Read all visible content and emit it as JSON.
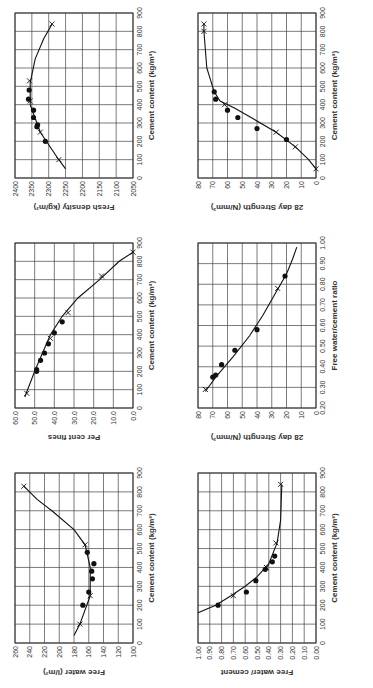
{
  "figure": {
    "rotation_deg": -90,
    "marker_legend": {
      "dot": "measured data point",
      "cross": "curve reference point"
    }
  },
  "chart_data": [
    {
      "id": "free-water",
      "type": "line",
      "xlabel": "Cement content (kg/m³)",
      "ylabel": "Free water (l/m³)",
      "xlim": [
        0,
        900
      ],
      "ylim": [
        100,
        260
      ],
      "xticks": [
        0,
        100,
        200,
        300,
        400,
        500,
        600,
        700,
        800,
        900
      ],
      "yticks": [
        100,
        120,
        140,
        160,
        180,
        200,
        220,
        240,
        260
      ],
      "grid": true,
      "curve": [
        [
          40,
          180
        ],
        [
          100,
          172
        ],
        [
          250,
          158
        ],
        [
          400,
          158
        ],
        [
          520,
          165
        ],
        [
          600,
          180
        ],
        [
          700,
          210
        ],
        [
          760,
          230
        ],
        [
          830,
          248
        ]
      ],
      "crosses": [
        [
          100,
          172
        ],
        [
          250,
          158
        ],
        [
          520,
          165
        ],
        [
          830,
          248
        ]
      ],
      "points": [
        [
          200,
          168
        ],
        [
          270,
          160
        ],
        [
          340,
          155
        ],
        [
          380,
          156
        ],
        [
          420,
          153
        ],
        [
          480,
          162
        ]
      ]
    },
    {
      "id": "per-cent-fines",
      "type": "line",
      "xlabel": "Cement content (kg/m³)",
      "ylabel": "Per cent fines",
      "xlim": [
        0,
        900
      ],
      "ylim": [
        0,
        60
      ],
      "xticks": [
        0,
        100,
        200,
        300,
        400,
        500,
        600,
        700,
        800,
        900
      ],
      "yticks": [
        "0.0",
        "10.0",
        "20.0",
        "30.0",
        "40.0",
        "50.0",
        "60.0"
      ],
      "grid": true,
      "curve": [
        [
          60,
          55
        ],
        [
          200,
          50
        ],
        [
          300,
          46
        ],
        [
          400,
          42
        ],
        [
          500,
          36
        ],
        [
          600,
          28
        ],
        [
          700,
          17
        ],
        [
          800,
          7
        ],
        [
          850,
          0
        ]
      ],
      "crosses": [
        [
          80,
          54
        ],
        [
          380,
          42
        ],
        [
          520,
          33
        ],
        [
          720,
          16
        ],
        [
          850,
          0
        ]
      ],
      "points": [
        [
          200,
          49
        ],
        [
          210,
          49
        ],
        [
          260,
          47
        ],
        [
          300,
          45
        ],
        [
          350,
          43
        ],
        [
          410,
          40
        ],
        [
          470,
          36
        ]
      ]
    },
    {
      "id": "fresh-density",
      "type": "line",
      "xlabel": "Cement content (kg/m³)",
      "ylabel": "Fresh density (kg/m³)",
      "xlim": [
        0,
        900
      ],
      "ylim": [
        2050,
        2400
      ],
      "xticks": [
        0,
        100,
        200,
        300,
        400,
        500,
        600,
        700,
        800,
        900
      ],
      "yticks": [
        2050,
        2100,
        2150,
        2200,
        2250,
        2300,
        2350,
        2400
      ],
      "grid": true,
      "curve": [
        [
          50,
          2250
        ],
        [
          100,
          2270
        ],
        [
          250,
          2325
        ],
        [
          400,
          2355
        ],
        [
          520,
          2355
        ],
        [
          650,
          2340
        ],
        [
          760,
          2315
        ],
        [
          840,
          2290
        ]
      ],
      "crosses": [
        [
          100,
          2270
        ],
        [
          250,
          2325
        ],
        [
          420,
          2355
        ],
        [
          530,
          2357
        ],
        [
          840,
          2290
        ]
      ],
      "points": [
        [
          200,
          2310
        ],
        [
          280,
          2335
        ],
        [
          290,
          2333
        ],
        [
          330,
          2345
        ],
        [
          370,
          2345
        ],
        [
          430,
          2360
        ],
        [
          480,
          2358
        ]
      ]
    },
    {
      "id": "wc-vs-cement",
      "type": "line",
      "xlabel": "Cement content (kg/m³)",
      "ylabel": "Free water/ cement",
      "xlim": [
        0,
        900
      ],
      "ylim": [
        0,
        1.0
      ],
      "xticks": [
        0,
        100,
        200,
        300,
        400,
        500,
        600,
        700,
        800,
        900
      ],
      "yticks": [
        "0.00",
        "0.10",
        "0.20",
        "0.30",
        "0.40",
        "0.50",
        "0.60",
        "0.70",
        "0.80",
        "0.90",
        "1.00"
      ],
      "grid": true,
      "curve": [
        [
          160,
          1.0
        ],
        [
          200,
          0.85
        ],
        [
          250,
          0.72
        ],
        [
          300,
          0.6
        ],
        [
          350,
          0.5
        ],
        [
          420,
          0.4
        ],
        [
          530,
          0.33
        ],
        [
          650,
          0.3
        ],
        [
          840,
          0.29
        ]
      ],
      "crosses": [
        [
          250,
          0.7
        ],
        [
          400,
          0.42
        ],
        [
          530,
          0.34
        ],
        [
          840,
          0.3
        ]
      ],
      "points": [
        [
          200,
          0.83
        ],
        [
          270,
          0.59
        ],
        [
          330,
          0.51
        ],
        [
          390,
          0.43
        ],
        [
          430,
          0.37
        ],
        [
          460,
          0.35
        ]
      ]
    },
    {
      "id": "strength-vs-wc",
      "type": "line",
      "xlabel": "Free water/cement ratio",
      "ylabel": "28 day Strength (N/mm²)",
      "xlim": [
        0.2,
        1.0
      ],
      "ylim": [
        0,
        80
      ],
      "xticks": [
        "0.20",
        "0.30",
        "0.40",
        "0.50",
        "0.60",
        "0.70",
        "0.80",
        "0.90",
        "1.00"
      ],
      "yticks": [
        0,
        10,
        20,
        30,
        40,
        50,
        60,
        70,
        80
      ],
      "grid": true,
      "curve": [
        [
          0.28,
          75
        ],
        [
          0.35,
          68
        ],
        [
          0.45,
          56
        ],
        [
          0.55,
          45
        ],
        [
          0.65,
          36
        ],
        [
          0.75,
          28
        ],
        [
          0.85,
          20
        ],
        [
          0.92,
          16
        ],
        [
          0.98,
          13
        ]
      ],
      "crosses": [
        [
          0.29,
          75
        ],
        [
          0.78,
          26
        ]
      ],
      "points": [
        [
          0.35,
          70
        ],
        [
          0.36,
          68
        ],
        [
          0.41,
          64
        ],
        [
          0.48,
          55
        ],
        [
          0.58,
          40
        ],
        [
          0.84,
          21
        ]
      ]
    },
    {
      "id": "strength-vs-cement",
      "type": "line",
      "xlabel": "Cement content (kg/m³)",
      "ylabel": "28 day Strength (N/mm²)",
      "xlim": [
        0,
        900
      ],
      "ylim": [
        0,
        80
      ],
      "xticks": [
        0,
        100,
        200,
        300,
        400,
        500,
        600,
        700,
        800,
        900
      ],
      "yticks": [
        0,
        10,
        20,
        30,
        40,
        50,
        60,
        70,
        80
      ],
      "grid": true,
      "curve": [
        [
          50,
          0
        ],
        [
          100,
          5
        ],
        [
          170,
          14
        ],
        [
          250,
          27
        ],
        [
          320,
          42
        ],
        [
          380,
          55
        ],
        [
          420,
          65
        ],
        [
          470,
          69
        ],
        [
          600,
          74
        ],
        [
          800,
          76
        ],
        [
          840,
          76
        ]
      ],
      "crosses": [
        [
          50,
          0
        ],
        [
          170,
          14
        ],
        [
          250,
          27
        ],
        [
          400,
          62
        ],
        [
          800,
          76
        ],
        [
          840,
          76
        ]
      ],
      "points": [
        [
          210,
          20
        ],
        [
          270,
          40
        ],
        [
          330,
          53
        ],
        [
          370,
          60
        ],
        [
          430,
          68
        ],
        [
          470,
          69
        ]
      ]
    }
  ]
}
